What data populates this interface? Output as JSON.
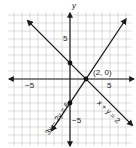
{
  "problem_marker": "",
  "graph": {
    "title": "System of linear equations graphed on a coordinate plane",
    "x_axis_label": "x",
    "y_axis_label": "y",
    "tick_labels": {
      "x_neg": "−5",
      "x_pos": "5",
      "y_pos": "5",
      "y_neg": "−5"
    },
    "grid": {
      "xmin": -8,
      "xmax": 8,
      "ymin": -8,
      "ymax": 8,
      "unit_px": 8,
      "origin_px": [
        70,
        79
      ]
    },
    "lines": [
      {
        "equation": "x + y = 2",
        "label": "x + y = 2",
        "slope": -1,
        "intercept": 2
      },
      {
        "equation": "3x − 2y = 6",
        "label": "3x − 2y = 6",
        "slope": 1.5,
        "intercept": -3
      }
    ],
    "points": [
      {
        "x": 0,
        "y": 2,
        "label": ""
      },
      {
        "x": 0,
        "y": -3,
        "label": ""
      },
      {
        "x": 2,
        "y": 0,
        "label": "(2, 0)"
      }
    ],
    "intersection_label": "(2, 0)",
    "colors": {
      "grid": "#c8c8c8",
      "axis": "#1a1a1a",
      "line": "#1a1a1a",
      "point": "#111111"
    }
  }
}
